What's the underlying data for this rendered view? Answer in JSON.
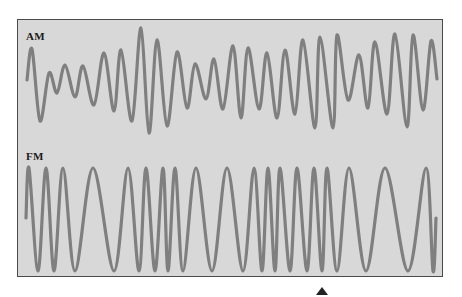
{
  "figure": {
    "panels": [
      {
        "id": "am",
        "label": "AM"
      },
      {
        "id": "fm",
        "label": "FM"
      }
    ],
    "colors": {
      "background": "#ffffff",
      "panel_fill": "#d8d8d8",
      "panel_border": "#4a4a4a",
      "wave_stroke": "#7f7f7f",
      "label_text": "#1a1a1a",
      "pointer": "#222222"
    },
    "pointer_icon": "triangle-up"
  },
  "chart_data": {
    "type": "line",
    "title": "",
    "xlabel": "",
    "ylabel": "",
    "note": "No axes or numeric scales are shown in the image. Values below are pixel coordinates of extrema traced from the screenshot, used to reproduce the curve shapes.",
    "series": [
      {
        "name": "AM",
        "points": [
          [
            27,
            80
          ],
          [
            32,
            49
          ],
          [
            40,
            121
          ],
          [
            49,
            73
          ],
          [
            57,
            93
          ],
          [
            65,
            65
          ],
          [
            75,
            97
          ],
          [
            83,
            66
          ],
          [
            94,
            105
          ],
          [
            104,
            53
          ],
          [
            114,
            111
          ],
          [
            121,
            50
          ],
          [
            132,
            121
          ],
          [
            141,
            28
          ],
          [
            149,
            133
          ],
          [
            157,
            40
          ],
          [
            167,
            126
          ],
          [
            177,
            52
          ],
          [
            187,
            108
          ],
          [
            195,
            64
          ],
          [
            206,
            99
          ],
          [
            214,
            59
          ],
          [
            223,
            109
          ],
          [
            233,
            46
          ],
          [
            241,
            118
          ],
          [
            248,
            48
          ],
          [
            259,
            109
          ],
          [
            267,
            53
          ],
          [
            277,
            118
          ],
          [
            285,
            50
          ],
          [
            295,
            114
          ],
          [
            303,
            40
          ],
          [
            315,
            128
          ],
          [
            320,
            37
          ],
          [
            333,
            128
          ],
          [
            337,
            35
          ],
          [
            348,
            100
          ],
          [
            359,
            55
          ],
          [
            368,
            108
          ],
          [
            375,
            42
          ],
          [
            387,
            114
          ],
          [
            395,
            34
          ],
          [
            407,
            127
          ],
          [
            413,
            35
          ],
          [
            423,
            110
          ],
          [
            431,
            41
          ],
          [
            437,
            79
          ]
        ]
      },
      {
        "name": "FM",
        "peak_y": 168,
        "trough_y": 271,
        "start": [
          26,
          218
        ],
        "end": [
          436,
          218
        ],
        "extrema_x": [
          29,
          38,
          46,
          54,
          63,
          75,
          93,
          114,
          128,
          139,
          146,
          155,
          163,
          168,
          175,
          183,
          196,
          212,
          227,
          243,
          254,
          262,
          268,
          275,
          280,
          290,
          297,
          307,
          314,
          322,
          327,
          337,
          349,
          366,
          385,
          408,
          426,
          433
        ]
      }
    ]
  }
}
